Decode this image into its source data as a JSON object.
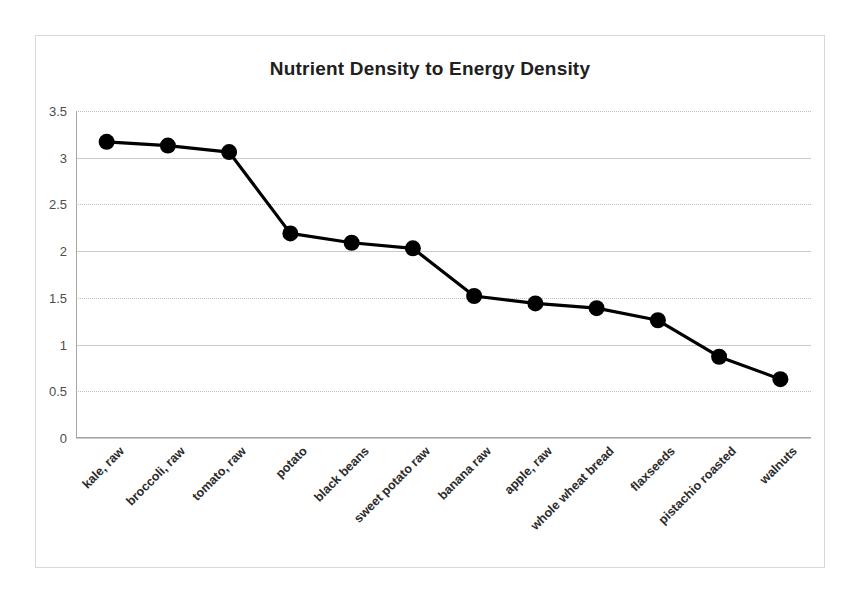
{
  "chart_data": {
    "type": "line",
    "title": "Nutrient Density to Energy Density",
    "xlabel": "",
    "ylabel": "",
    "ylim": [
      0,
      3.5
    ],
    "yticks": [
      "0",
      "0.5",
      "1",
      "1.5",
      "2",
      "2.5",
      "3",
      "3.5"
    ],
    "ytick_values": [
      0,
      0.5,
      1,
      1.5,
      2,
      2.5,
      3,
      3.5
    ],
    "grid": "horizontal",
    "legend": "none",
    "marker": "filled-circle",
    "series_color": "#000000",
    "grid_color": "#bfbfbf",
    "axis_color": "#a6a6a6",
    "border_color": "#d9d9d9",
    "categories": [
      "kale, raw",
      "broccoli, raw",
      "tomato, raw",
      "potato",
      "black beans",
      "sweet potato raw",
      "banana raw",
      "apple, raw",
      "whole wheat bread",
      "flaxseeds",
      "pistachio roasted",
      "walnuts"
    ],
    "values": [
      3.17,
      3.13,
      3.06,
      2.19,
      2.09,
      2.03,
      1.52,
      1.44,
      1.39,
      1.26,
      0.87,
      0.63
    ]
  }
}
